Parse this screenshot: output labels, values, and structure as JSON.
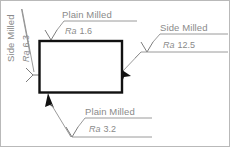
{
  "drawing": {
    "title": "Surface finish symbols on machined part",
    "part": {
      "name": "rectangular-part",
      "outline_color": "#111111"
    },
    "colors": {
      "annotation_text": "#8a8a8a",
      "leader_line": "#8f8f8f",
      "part_outline": "#111111",
      "frame": "#b9b9b9",
      "background": "#ffffff"
    },
    "annotations": [
      {
        "id": "left",
        "process": "Side Milled",
        "ra_symbol": "Ra",
        "ra_value": "6.3",
        "orientation": "vertical",
        "target_edge": "left"
      },
      {
        "id": "top",
        "process": "Plain Milled",
        "ra_symbol": "Ra",
        "ra_value": "1.6",
        "orientation": "horizontal",
        "target_edge": "top"
      },
      {
        "id": "right",
        "process": "Side Milled",
        "ra_symbol": "Ra",
        "ra_value": "12.5",
        "orientation": "horizontal",
        "target_edge": "right"
      },
      {
        "id": "bottom",
        "process": "Plain Milled",
        "ra_symbol": "Ra",
        "ra_value": "3.2",
        "orientation": "horizontal",
        "target_edge": "bottom"
      }
    ]
  }
}
